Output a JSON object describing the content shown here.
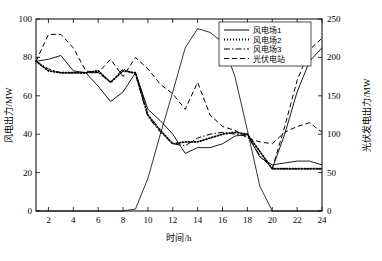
{
  "chart_data": {
    "type": "line",
    "title": "",
    "xlabel": "时间/h",
    "ylabel": "风电出力/MW",
    "y2label": "光伏发电出力/MW",
    "xlim": [
      1,
      24
    ],
    "ylim": [
      0,
      100
    ],
    "y2lim": [
      0,
      250
    ],
    "grid": false,
    "legend_position": "top-right",
    "x": [
      1,
      2,
      3,
      4,
      5,
      6,
      7,
      8,
      9,
      10,
      11,
      12,
      13,
      14,
      15,
      16,
      17,
      18,
      19,
      20,
      21,
      22,
      23,
      24
    ],
    "xticks": [
      2,
      4,
      6,
      8,
      10,
      12,
      14,
      16,
      18,
      20,
      22,
      24
    ],
    "yticks": [
      0,
      20,
      40,
      60,
      80,
      100
    ],
    "y2ticks": [
      0,
      50,
      100,
      150,
      200,
      250
    ],
    "series": [
      {
        "name": "风电场1",
        "axis": "left",
        "style": "solid",
        "width": 0.9,
        "values": [
          78,
          79,
          81,
          73,
          72,
          65,
          57,
          62,
          72,
          53,
          47,
          40,
          30,
          33,
          33,
          35,
          39,
          40,
          28,
          24,
          25,
          26,
          26,
          24
        ]
      },
      {
        "name": "风电场2",
        "axis": "left",
        "style": "dotted",
        "width": 1.8,
        "values": [
          78,
          73,
          72,
          72,
          72,
          73,
          67,
          73,
          72,
          50,
          42,
          35,
          36,
          36,
          38,
          40,
          41,
          40,
          31,
          22,
          22,
          22,
          22,
          22
        ]
      },
      {
        "name": "风电场3",
        "axis": "left",
        "style": "dashdot",
        "width": 1.0,
        "values": [
          78,
          74,
          72,
          72,
          72,
          72,
          67,
          74,
          71,
          49,
          41,
          35,
          34,
          38,
          40,
          41,
          40,
          39,
          29,
          22,
          22,
          22,
          22,
          22
        ]
      },
      {
        "name": "光伏电站",
        "axis": "right",
        "style": "dashed",
        "width": 1.0,
        "values": [
          78,
          92,
          92,
          85,
          73,
          72,
          79,
          70,
          80,
          74,
          66,
          61,
          53,
          67,
          50,
          44,
          42,
          38,
          36,
          35,
          41,
          44,
          46,
          41
        ]
      },
      {
        "name": "pv-solar",
        "axis": "right",
        "style": "solid",
        "width": 0.8,
        "values": [
          0,
          0,
          0,
          0,
          0,
          0,
          0,
          0,
          1,
          17,
          40,
          62,
          85,
          95,
          93,
          88,
          70,
          42,
          13,
          0,
          0,
          0,
          0,
          0
        ]
      },
      {
        "name": "rise-tail-a",
        "axis": "left",
        "style": "dashed",
        "width": 1.0,
        "values": [
          null,
          null,
          null,
          null,
          null,
          null,
          null,
          null,
          null,
          null,
          null,
          null,
          null,
          null,
          null,
          null,
          null,
          null,
          null,
          22,
          44,
          68,
          84,
          90
        ]
      },
      {
        "name": "rise-tail-b",
        "axis": "left",
        "style": "solid",
        "width": 0.9,
        "values": [
          null,
          null,
          null,
          null,
          null,
          null,
          null,
          null,
          null,
          null,
          null,
          null,
          null,
          null,
          null,
          null,
          null,
          null,
          null,
          22,
          40,
          62,
          78,
          85
        ]
      }
    ],
    "legend": [
      {
        "label": "风电场1",
        "style": "solid"
      },
      {
        "label": "风电场2",
        "style": "dotted"
      },
      {
        "label": "风电场3",
        "style": "dashdot"
      },
      {
        "label": "光伏电站",
        "style": "dashed"
      }
    ]
  }
}
